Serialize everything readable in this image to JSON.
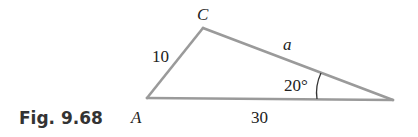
{
  "figure": {
    "caption": "Fig. 9.68",
    "triangle": {
      "vertices": {
        "A": {
          "label": "A"
        },
        "B": {
          "label": ""
        },
        "C": {
          "label": "C"
        }
      },
      "sides": {
        "AC": {
          "label": "10"
        },
        "BC": {
          "label": "a"
        },
        "AB": {
          "label": "30"
        }
      },
      "angles": {
        "B": {
          "label": "20°"
        }
      }
    },
    "colors": {
      "side_stroke": "#9a9a9a",
      "text": "#222222",
      "caption_text": "#333333"
    }
  }
}
